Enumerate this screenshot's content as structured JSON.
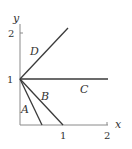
{
  "diagram": {
    "axes": {
      "x_label": "x",
      "y_label": "y",
      "x_ticks": [
        "1",
        "2"
      ],
      "y_ticks": [
        "1",
        "2"
      ]
    },
    "lines": [
      {
        "label": "A",
        "from": [
          0,
          1
        ],
        "to": [
          0.5,
          0
        ]
      },
      {
        "label": "B",
        "from": [
          0,
          1
        ],
        "to": [
          1,
          0
        ]
      },
      {
        "label": "C",
        "from": [
          0,
          1
        ],
        "to": [
          2,
          1
        ]
      },
      {
        "label": "D",
        "from": [
          0,
          1
        ],
        "to": [
          1.1,
          2.1
        ]
      }
    ],
    "colors": {
      "axis": "#8a8a8a",
      "line": "#3a3a3a",
      "text": "#333333"
    }
  }
}
